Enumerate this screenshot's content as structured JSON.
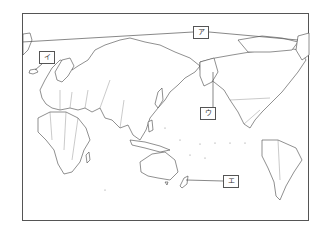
{
  "map": {
    "type": "world-map-pacific-centered",
    "style": "blank outline map with country borders",
    "labels": [
      {
        "id": "a",
        "text": "ア",
        "x": 193,
        "y": 26,
        "target": "latitude line near Arctic Circle"
      },
      {
        "id": "i",
        "text": "イ",
        "x": 39,
        "y": 51,
        "target": "Iceland"
      },
      {
        "id": "u",
        "text": "ウ",
        "x": 200,
        "y": 107,
        "target": "Alaska"
      },
      {
        "id": "e",
        "text": "エ",
        "x": 223,
        "y": 175,
        "target": "New Zealand"
      }
    ],
    "colors": {
      "stroke": "#444444",
      "background": "#ffffff"
    }
  }
}
